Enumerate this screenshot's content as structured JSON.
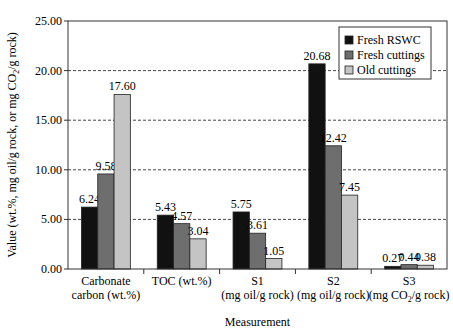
{
  "chart_data": {
    "type": "bar",
    "title": "",
    "xlabel": "Measurement",
    "ylabel": "Value (wt.%, mg oil/g rock, or mg CO2/g rock)",
    "ylim": [
      0,
      25
    ],
    "yticks": [
      "0.00",
      "5.00",
      "10.00",
      "15.00",
      "20.00",
      "25.00"
    ],
    "grid": "horizontal dashed",
    "legend_position": "upper right (inside)",
    "categories": [
      [
        "Carbonate",
        "carbon (wt.%)"
      ],
      [
        "TOC (wt.%)"
      ],
      [
        "S1",
        "(mg oil/g rock)"
      ],
      [
        "S2",
        "(mg oil/g rock)"
      ],
      [
        "S3",
        "(mg CO2/g rock)"
      ]
    ],
    "series": [
      {
        "name": "Fresh RSWC",
        "color": "#111111",
        "values": [
          6.24,
          5.43,
          5.75,
          20.68,
          0.27
        ],
        "labels": [
          "6.24",
          "5.43",
          "5.75",
          "20.68",
          "0.27"
        ]
      },
      {
        "name": "Fresh cuttings",
        "color": "#6e6e6e",
        "values": [
          9.58,
          4.57,
          3.61,
          12.42,
          0.44
        ],
        "labels": [
          "9.58",
          "4.57",
          "3.61",
          "12.42",
          "0.44"
        ]
      },
      {
        "name": "Old cuttings",
        "color": "#c4c4c4",
        "values": [
          17.6,
          3.04,
          1.05,
          7.45,
          0.38
        ],
        "labels": [
          "17.60",
          "3.04",
          "1.05",
          "7.45",
          "0.38"
        ]
      }
    ]
  }
}
